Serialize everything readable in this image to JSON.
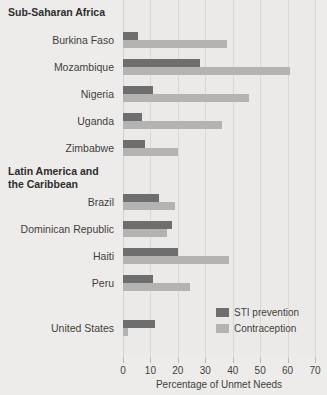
{
  "chart_data": {
    "type": "bar",
    "orientation": "horizontal",
    "title": "",
    "xlabel": "Percentage of Unmet Needs",
    "ylabel": "",
    "xlim": [
      0,
      70
    ],
    "xticks": [
      0,
      10,
      20,
      30,
      40,
      50,
      60,
      70
    ],
    "grid": true,
    "legend_position": "inside-bottom-right",
    "colors": {
      "sti_prevention": "#6e6e6e",
      "contraception": "#b4b3b1",
      "background": "#edecea",
      "gridline": "#dad8d5"
    },
    "series": [
      {
        "name": "STI prevention",
        "key": "sti",
        "color": "#6e6e6e"
      },
      {
        "name": "Contraception",
        "key": "contra",
        "color": "#b4b3b1"
      }
    ],
    "groups": [
      {
        "label": "Sub-Saharan Africa",
        "label_lines": [
          "Sub-Saharan Africa"
        ],
        "categories": [
          "Burkina Faso",
          "Mozambique",
          "Nigeria",
          "Uganda",
          "Zimbabwe"
        ],
        "sti": [
          5.5,
          28,
          11,
          7,
          8
        ],
        "contra": [
          38,
          61,
          46,
          36,
          20
        ]
      },
      {
        "label": "Latin America and the Caribbean",
        "label_lines": [
          "Latin America and",
          "the Caribbean"
        ],
        "categories": [
          "Brazil",
          "Dominican Republic",
          "Haiti",
          "Peru"
        ],
        "sti": [
          13,
          18,
          20,
          11
        ],
        "contra": [
          19,
          16,
          38.5,
          24.5
        ]
      },
      {
        "label": "",
        "label_lines": [],
        "categories": [
          "United States"
        ],
        "sti": [
          11.5
        ],
        "contra": [
          2
        ]
      }
    ]
  },
  "axis": {
    "tick_labels": [
      "0",
      "10",
      "20",
      "30",
      "40",
      "50",
      "60",
      "70"
    ],
    "title": "Percentage of Unmet Needs"
  },
  "legend": {
    "items": [
      {
        "label": "STI prevention"
      },
      {
        "label": "Contraception"
      }
    ]
  },
  "row_labels": [
    "Burkina Faso",
    "Mozambique",
    "Nigeria",
    "Uganda",
    "Zimbabwe",
    "Brazil",
    "Dominican Republic",
    "Haiti",
    "Peru",
    "United States"
  ],
  "group_headers": [
    {
      "lines": [
        "Sub-Saharan Africa"
      ]
    },
    {
      "lines": [
        "Latin America and",
        "the Caribbean"
      ]
    }
  ]
}
